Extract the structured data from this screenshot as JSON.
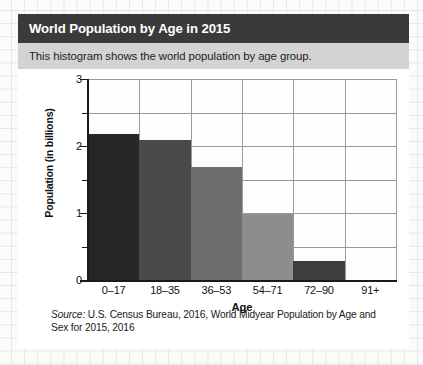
{
  "card": {
    "title": "World Population by Age in 2015",
    "subtitle": "This histogram shows the world population by age group."
  },
  "source": {
    "prefix": "Source:",
    "text": " U.S. Census Bureau, 2016, World Midyear Population by Age and Sex for 2015, 2016"
  },
  "axis": {
    "y_ticks": [
      "3",
      "2",
      "1",
      "0"
    ],
    "y_label": "Population (in billions)",
    "x_label": "Age"
  },
  "colors": {
    "title_bar": "#3a3a3a",
    "subtitle_bar": "#d3d3d3",
    "axis": "#1a1a1a",
    "grid": "#9a9a9a",
    "page_bg": "#fbfbfa",
    "card_bg": "#ffffff"
  },
  "chart_data": {
    "type": "bar",
    "title": "World Population by Age in 2015",
    "subtitle": "This histogram shows the world population by age group.",
    "categories": [
      "0–17",
      "18–35",
      "36–53",
      "54–71",
      "72–90",
      "91+"
    ],
    "values": [
      2.2,
      2.1,
      1.7,
      1.0,
      0.3,
      0.0
    ],
    "bar_colors": [
      "#262626",
      "#4a4a4a",
      "#6e6e6e",
      "#8d8d8d",
      "#3d3d3d",
      "#fdfdfd"
    ],
    "xlabel": "Age",
    "ylabel": "Population (in billions)",
    "ylim": [
      0,
      3
    ],
    "y_major_ticks": [
      0,
      1,
      2,
      3
    ],
    "y_minor_ticks": [
      0.5,
      1.5,
      2.5
    ],
    "grid": true,
    "legend": false,
    "source": "Source: U.S. Census Bureau, 2016, World Midyear Population by Age and Sex for 2015, 2016"
  }
}
